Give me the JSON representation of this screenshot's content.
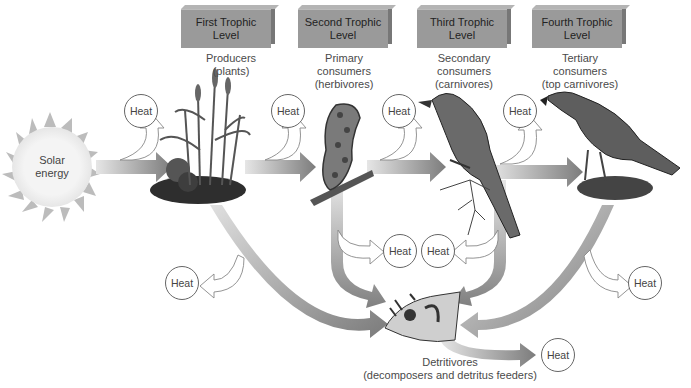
{
  "diagram": {
    "type": "food-chain-energy-flow",
    "color_scheme": "grayscale",
    "source": {
      "label": "Solar energy"
    },
    "trophic_levels": [
      {
        "box": "First Trophic Level",
        "role_line1": "Producers",
        "role_line2": "(plants)"
      },
      {
        "box": "Second Trophic Level",
        "role_line1": "Primary",
        "role_line2": "consumers",
        "role_line3": "(herbivores)"
      },
      {
        "box": "Third Trophic Level",
        "role_line1": "Secondary",
        "role_line2": "consumers",
        "role_line3": "(carnivores)"
      },
      {
        "box": "Fourth Trophic Level",
        "role_line1": "Tertiary",
        "role_line2": "consumers",
        "role_line3": "(top carnivores)"
      }
    ],
    "level_box_lines": [
      [
        "First Trophic",
        "Level"
      ],
      [
        "Second Trophic",
        "Level"
      ],
      [
        "Third Trophic",
        "Level"
      ],
      [
        "Fourth Trophic",
        "Level"
      ]
    ],
    "detritivores": {
      "line1": "Detritivores",
      "line2": "(decomposers and detritus feeders)"
    },
    "heat_label": "Heat",
    "heat_nodes": [
      "Heat",
      "Heat",
      "Heat",
      "Heat",
      "Heat",
      "Heat",
      "Heat",
      "Heat",
      "Heat"
    ],
    "organisms": [
      "plants",
      "caterpillar",
      "songbird",
      "hawk",
      "detritivores"
    ],
    "colors": {
      "level_box": "#9a9a9a",
      "arrow_dark": "#808080",
      "arrow_light": "#dcdcdc",
      "sun": "#bdbdbd",
      "heat_circle_stroke": "#666666"
    }
  }
}
